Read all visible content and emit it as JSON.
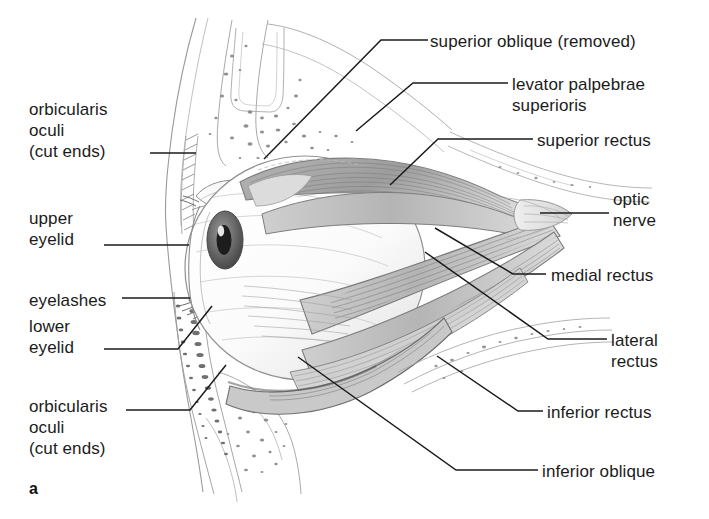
{
  "figure": {
    "panel_letter": "a",
    "caption_subject": "lateral view of the right eye and extraocular muscles within the orbit",
    "background_color": "#ffffff",
    "ink_color": "#1b1b1b",
    "style": "pencil line drawing"
  },
  "labels": {
    "left": [
      {
        "id": "orbicularis-oculi-upper",
        "lines": [
          "orbicularis",
          "oculi",
          "(cut ends)"
        ],
        "x": 29,
        "y": 99
      },
      {
        "id": "upper-eyelid",
        "lines": [
          "upper",
          "eyelid"
        ],
        "x": 29,
        "y": 208
      },
      {
        "id": "eyelashes",
        "lines": [
          "eyelashes"
        ],
        "x": 29,
        "y": 290
      },
      {
        "id": "lower-eyelid",
        "lines": [
          "lower",
          "eyelid"
        ],
        "x": 29,
        "y": 316
      },
      {
        "id": "orbicularis-oculi-lower",
        "lines": [
          "orbicularis",
          "oculi",
          "(cut ends)"
        ],
        "x": 29,
        "y": 396
      }
    ],
    "right": [
      {
        "id": "superior-oblique",
        "lines": [
          "superior oblique (removed)"
        ],
        "x": 430,
        "y": 31
      },
      {
        "id": "levator-palpebrae",
        "lines": [
          "levator palpebrae",
          "superioris"
        ],
        "x": 512,
        "y": 74
      },
      {
        "id": "superior-rectus",
        "lines": [
          "superior rectus"
        ],
        "x": 537,
        "y": 130
      },
      {
        "id": "optic-nerve",
        "lines": [
          "optic",
          "nerve"
        ],
        "x": 613,
        "y": 189
      },
      {
        "id": "medial-rectus",
        "lines": [
          "medial rectus"
        ],
        "x": 551,
        "y": 265
      },
      {
        "id": "lateral-rectus",
        "lines": [
          "lateral",
          "rectus"
        ],
        "x": 611,
        "y": 330
      },
      {
        "id": "inferior-rectus",
        "lines": [
          "inferior rectus"
        ],
        "x": 547,
        "y": 402
      },
      {
        "id": "inferior-oblique",
        "lines": [
          "inferior oblique"
        ],
        "x": 542,
        "y": 461
      }
    ]
  },
  "leaders": [
    {
      "id": "leader-orbicularis-upper",
      "points": "150,153 196,153"
    },
    {
      "id": "leader-upper-eyelid",
      "points": "104,245 189,245"
    },
    {
      "id": "leader-eyelashes",
      "points": "122,298 190,298"
    },
    {
      "id": "leader-lower-eyelid",
      "points": "104,349 178,349 212,306"
    },
    {
      "id": "leader-orbicularis-lower",
      "points": "126,410 190,410 226,365"
    },
    {
      "id": "leader-superior-oblique",
      "points": "428,40 381,40 264,159"
    },
    {
      "id": "leader-levator",
      "points": "508,83 413,83 356,131"
    },
    {
      "id": "leader-superior-rectus",
      "points": "533,139 438,139 390,185"
    },
    {
      "id": "leader-optic-nerve",
      "points": "609,213 540,213"
    },
    {
      "id": "leader-medial-rectus",
      "points": "546,274 513,274 435,228"
    },
    {
      "id": "leader-lateral-rectus",
      "points": "607,339 548,339 425,252"
    },
    {
      "id": "leader-inferior-rectus",
      "points": "543,411 518,411 437,356"
    },
    {
      "id": "leader-inferior-oblique",
      "points": "538,470 456,470 298,357"
    }
  ]
}
